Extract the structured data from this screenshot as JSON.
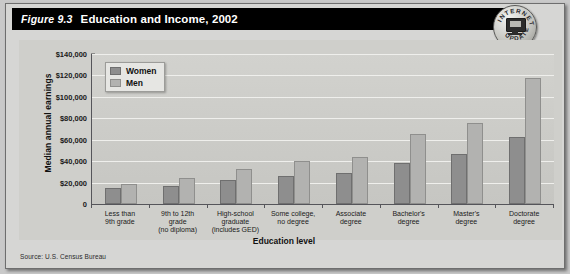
{
  "figure": {
    "number": "Figure 9.3",
    "title": "Education and Income, 2002",
    "source": "Source: U.S. Census Bureau"
  },
  "badge": {
    "top_text": "INTERNET",
    "bottom_text": "UPDATE",
    "icon": "computer-monitor-icon"
  },
  "colors": {
    "titlebar_bg": "#000000",
    "titlebar_text": "#ffffff",
    "panel_bg": "#cfcfcb",
    "plot_bg": "#cbcbc7",
    "gridline": "#efefec",
    "women_bar": "#8e8e8e",
    "men_bar": "#b2b2b0",
    "axis": "#55555a"
  },
  "chart_data": {
    "type": "bar",
    "title": "Education and Income, 2002",
    "xlabel": "Education level",
    "ylabel": "Median annual earnings",
    "ylim": [
      0,
      140000
    ],
    "ytick_values": [
      0,
      20000,
      40000,
      60000,
      80000,
      100000,
      120000,
      140000
    ],
    "ytick_labels": [
      "0",
      "$20,000",
      "$40,000",
      "$60,000",
      "$80,000",
      "$100,000",
      "$120,000",
      "$140,000"
    ],
    "grid": true,
    "legend_position": "top-left",
    "categories": [
      "Less than\n9th grade",
      "9th to 12th\ngrade\n(no diploma)",
      "High-school\ngraduate\n(includes GED)",
      "Some college,\nno degree",
      "Associate\ndegree",
      "Bachelor's\ndegree",
      "Master's\ndegree",
      "Doctorate\ndegree"
    ],
    "series": [
      {
        "name": "Women",
        "color": "#8e8e8e",
        "values": [
          15000,
          17000,
          22000,
          26000,
          29000,
          38000,
          47000,
          63000
        ]
      },
      {
        "name": "Men",
        "color": "#b2b2b0",
        "values": [
          19000,
          24000,
          33000,
          40000,
          44000,
          65000,
          76000,
          118000
        ]
      }
    ]
  }
}
